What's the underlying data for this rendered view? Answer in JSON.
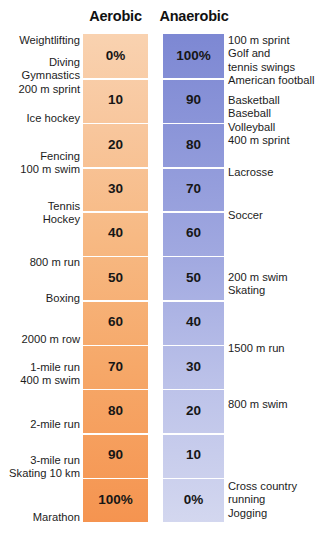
{
  "chart_data": {
    "type": "bar",
    "title": "",
    "xlabel": "",
    "ylabel": "",
    "grid": false,
    "legend_position": "top",
    "columns": [
      "Aerobic",
      "Anaerobic"
    ],
    "categories": [
      "0%",
      "10",
      "20",
      "30",
      "40",
      "50",
      "60",
      "70",
      "80",
      "90",
      "100%"
    ],
    "series": [
      {
        "name": "Aerobic",
        "values": [
          0,
          10,
          20,
          30,
          40,
          50,
          60,
          70,
          80,
          90,
          100
        ]
      },
      {
        "name": "Anaerobic",
        "values": [
          100,
          90,
          80,
          70,
          60,
          50,
          40,
          30,
          20,
          10,
          0
        ]
      }
    ],
    "rows": [
      {
        "aerobic": "0%",
        "anaerobic": "100%"
      },
      {
        "aerobic": "10",
        "anaerobic": "90"
      },
      {
        "aerobic": "20",
        "anaerobic": "80"
      },
      {
        "aerobic": "30",
        "anaerobic": "70"
      },
      {
        "aerobic": "40",
        "anaerobic": "60"
      },
      {
        "aerobic": "50",
        "anaerobic": "50"
      },
      {
        "aerobic": "60",
        "anaerobic": "40"
      },
      {
        "aerobic": "70",
        "anaerobic": "30"
      },
      {
        "aerobic": "80",
        "anaerobic": "20"
      },
      {
        "aerobic": "90",
        "anaerobic": "10"
      },
      {
        "aerobic": "100%",
        "anaerobic": "0%"
      }
    ],
    "left_annotations": [
      {
        "text": "Weightlifting",
        "top": 0
      },
      {
        "text": "Diving\nGymnastics\n200 m sprint",
        "top": 22
      },
      {
        "text": "Ice hockey",
        "top": 78
      },
      {
        "text": "Fencing\n100 m swim",
        "top": 116
      },
      {
        "text": "Tennis\nHockey",
        "top": 166
      },
      {
        "text": "800 m run",
        "top": 222
      },
      {
        "text": "Boxing",
        "top": 258
      },
      {
        "text": "2000 m row",
        "top": 299
      },
      {
        "text": "1-mile run\n400 m swim",
        "top": 327
      },
      {
        "text": "2-mile run",
        "top": 384
      },
      {
        "text": "3-mile run\nSkating 10 km",
        "top": 420
      },
      {
        "text": "Marathon",
        "top": 477
      }
    ],
    "right_annotations": [
      {
        "text": "100 m sprint\nGolf and\ntennis swings\nAmerican football",
        "top": 0
      },
      {
        "text": "Basketball\nBaseball\nVolleyball\n400 m sprint",
        "top": 60
      },
      {
        "text": "Lacrosse",
        "top": 132
      },
      {
        "text": "Soccer",
        "top": 175
      },
      {
        "text": "200 m swim\nSkating",
        "top": 237
      },
      {
        "text": "1500 m run",
        "top": 308
      },
      {
        "text": "800 m swim",
        "top": 364
      },
      {
        "text": "Cross country\nrunning\nJogging",
        "top": 446
      }
    ],
    "colors": {
      "aerobic_top": "#f9d2b0",
      "aerobic_bottom": "#f59450",
      "anaerobic_top": "#7d88d3",
      "anaerobic_bottom": "#d3d7ef",
      "divider": "#ffffff",
      "text": "#1a1a1a",
      "background": "#ffffff"
    }
  }
}
